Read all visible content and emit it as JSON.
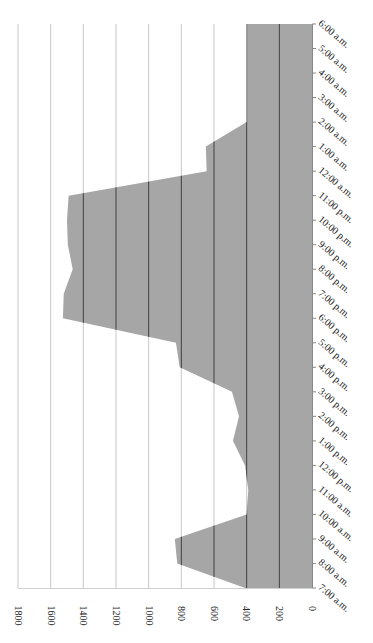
{
  "chart_data": {
    "type": "area",
    "orientation": "rotated 90deg clockwise (value axis along bottom, reading right-to-left; categories along right edge, bottom-to-top)",
    "title": "",
    "xlabel": "",
    "ylabel": "",
    "categories": [
      "7:00 a.m.",
      "8:00 a.m.",
      "9:00 a.m.",
      "10:00 a.m.",
      "11:00 a.m.",
      "12:00 p.m.",
      "1:00 p.m.",
      "2:00 p.m.",
      "3:00 p.m.",
      "4:00 p.m.",
      "5:00 p.m.",
      "6:00 p.m.",
      "7:00 p.m.",
      "8:00 p.m.",
      "9:00 p.m.",
      "10:00 p.m.",
      "11:00 p.m.",
      "12:00 a.m.",
      "1:00 a.m.",
      "2:00 a.m.",
      "3:00 a.m.",
      "4:00 a.m.",
      "5:00 a.m.",
      "6:00 a.m."
    ],
    "series": [
      {
        "name": "Series 1",
        "color": "#a6a6a6",
        "values": [
          410,
          825,
          840,
          400,
          390,
          410,
          484,
          447,
          490,
          810,
          833,
          1525,
          1520,
          1465,
          1495,
          1500,
          1490,
          645,
          650,
          400,
          400,
          400,
          400,
          400
        ]
      }
    ],
    "yticks": [
      "0",
      "200",
      "400",
      "600",
      "800",
      "1000",
      "1200",
      "1400",
      "1600",
      "1800"
    ],
    "ylim": [
      0,
      1800
    ],
    "grid": true,
    "legend": "none"
  },
  "colors": {
    "area": "#a6a6a6",
    "grid_on_area": "#404040",
    "grid_on_white": "#c8c8c8",
    "axis": "#888888"
  }
}
